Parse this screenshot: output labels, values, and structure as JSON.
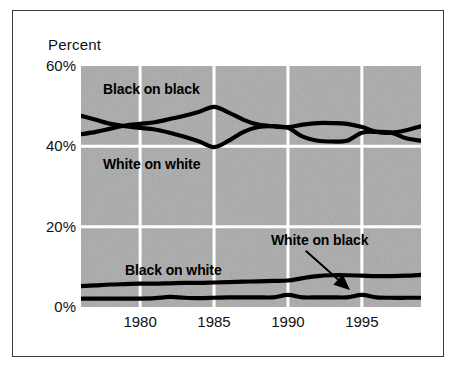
{
  "figure": {
    "y_axis_caption": "Percent"
  },
  "axes": {
    "y_ticks": [
      {
        "label": "60%",
        "value": 60
      },
      {
        "label": "40%",
        "value": 40
      },
      {
        "label": "20%",
        "value": 20
      },
      {
        "label": "0%",
        "value": 0
      }
    ],
    "x_ticks": [
      {
        "label": "1980",
        "value": 1980
      },
      {
        "label": "1985",
        "value": 1985
      },
      {
        "label": "1990",
        "value": 1990
      },
      {
        "label": "1995",
        "value": 1995
      }
    ]
  },
  "annotations": {
    "black_on_black": "Black on black",
    "white_on_white": "White on white",
    "black_on_white": "Black on white",
    "white_on_black": "White on black"
  },
  "colors": {
    "line": "#000000",
    "plot_background": "#a8a8a8",
    "gridline": "#ffffff",
    "frame": "#3a3a3a",
    "text": "#111111"
  },
  "chart_data": {
    "type": "line",
    "title": "",
    "subtitle": "",
    "xlabel": "",
    "ylabel": "Percent",
    "xlim": [
      1976,
      1999
    ],
    "ylim": [
      0,
      60
    ],
    "grid": "vertical and horizontal white gridlines at tick values",
    "legend": "inline labels inside plot area",
    "x": [
      1976,
      1977,
      1978,
      1979,
      1980,
      1981,
      1982,
      1983,
      1984,
      1985,
      1986,
      1987,
      1988,
      1989,
      1990,
      1991,
      1992,
      1993,
      1994,
      1995,
      1996,
      1997,
      1998,
      1999
    ],
    "series": [
      {
        "name": "Black on black",
        "label": "Black on black",
        "values": [
          43.0,
          43.6,
          44.4,
          45.2,
          45.6,
          46.0,
          46.8,
          47.6,
          48.6,
          49.8,
          48.4,
          46.6,
          45.4,
          45.0,
          44.8,
          45.4,
          45.8,
          45.8,
          45.6,
          44.8,
          43.6,
          43.4,
          44.0,
          45.0
        ]
      },
      {
        "name": "White on white",
        "label": "White on white",
        "values": [
          47.6,
          46.6,
          45.6,
          45.0,
          44.6,
          44.2,
          43.4,
          42.4,
          41.2,
          39.8,
          41.4,
          43.6,
          44.8,
          45.0,
          44.6,
          42.4,
          41.4,
          41.2,
          41.4,
          43.4,
          43.6,
          43.4,
          42.0,
          41.4
        ]
      },
      {
        "name": "Black on white",
        "label": "Black on white",
        "values": [
          5.2,
          5.4,
          5.6,
          5.7,
          5.8,
          5.8,
          5.9,
          6.0,
          6.0,
          6.1,
          6.2,
          6.3,
          6.4,
          6.5,
          6.6,
          7.2,
          7.7,
          7.9,
          7.9,
          7.8,
          7.7,
          7.7,
          7.8,
          8.0
        ]
      },
      {
        "name": "White on black",
        "label": "White on black",
        "values": [
          2.1,
          2.1,
          2.1,
          2.1,
          2.1,
          2.2,
          2.5,
          2.3,
          2.2,
          2.3,
          2.4,
          2.4,
          2.4,
          2.4,
          3.0,
          2.4,
          2.4,
          2.4,
          2.4,
          3.0,
          2.4,
          2.3,
          2.3,
          2.3
        ]
      }
    ],
    "annotation_arrow": {
      "text": "White on black",
      "points_to_series": "White on black",
      "from_x": 1991.2,
      "from_y": 14.0,
      "to_x": 1994.2,
      "to_y": 4.2
    }
  }
}
